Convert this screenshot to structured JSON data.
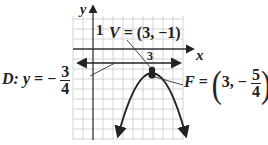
{
  "diagram": {
    "axes": {
      "x_label": "x",
      "y_label": "y",
      "tick_label_y": "1",
      "tick_label_x": "3"
    },
    "vertex": {
      "name": "V",
      "equals": "=",
      "value": "(3, −1)"
    },
    "focus": {
      "name": "F",
      "equals": "=",
      "x": "3,",
      "minus": "−",
      "y_num": "5",
      "y_den": "4",
      "open_paren": "(",
      "close_paren": ")"
    },
    "directrix": {
      "name": "D:",
      "var": "y",
      "equals": "=",
      "minus": "−",
      "num": "3",
      "den": "4"
    },
    "colors": {
      "grid": "#c8c8c8",
      "axis": "#333333",
      "curve": "#222222",
      "text": "#222222"
    }
  }
}
